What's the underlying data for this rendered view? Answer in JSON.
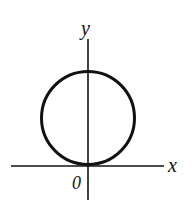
{
  "diagram": {
    "type": "coordinate-plot",
    "axes": {
      "x_label": "x",
      "y_label": "y",
      "origin_label": "0"
    },
    "shapes": [
      {
        "type": "circle",
        "center": "on positive y-axis",
        "tangent_to": "x-axis at origin"
      }
    ],
    "colors": {
      "stroke": "#111111",
      "background": "#ffffff"
    }
  }
}
